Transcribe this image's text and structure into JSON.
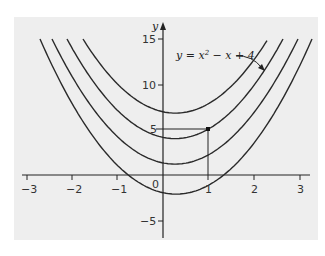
{
  "chart_data": {
    "type": "line",
    "title": "",
    "xlabel": "",
    "ylabel": "y",
    "xlim": [
      -3.1,
      3.3
    ],
    "ylim": [
      -7,
      17
    ],
    "grid": false,
    "x_ticks": [
      "−3",
      "−2",
      "−1",
      "0",
      "1",
      "2",
      "3"
    ],
    "y_ticks": [
      "15",
      "10",
      "5",
      "−5"
    ],
    "origin_label": "0",
    "series": [
      {
        "name": "curve-1",
        "vertex_y": 6.8,
        "family": "y = x² − x + c"
      },
      {
        "name": "y = x² − x + 4",
        "vertex_y": 4.0,
        "family": "y = x² − x + c"
      },
      {
        "name": "curve-3",
        "vertex_y": 1.2,
        "family": "y = x² − x + c"
      },
      {
        "name": "curve-4",
        "vertex_y": -2.1,
        "family": "y = x² − x + c"
      }
    ],
    "annotations": [
      {
        "text": "y = x² − x + 4",
        "points_to": "second curve from top"
      },
      {
        "type": "point",
        "x": 1,
        "y": 5,
        "guides": "dashed lines to x=1 and y=5"
      }
    ]
  },
  "labels": {
    "y_axis": "y",
    "eq_y": "y",
    "eq_eq": " = ",
    "eq_x": "x",
    "eq_sup": "2",
    "eq_rest": " − x + 4"
  }
}
